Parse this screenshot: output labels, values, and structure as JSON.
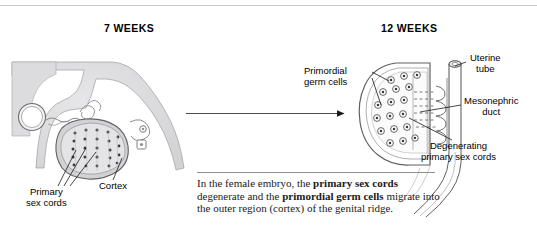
{
  "figure": {
    "stages": [
      {
        "id": "stage-7-weeks",
        "title": "7 WEEKS"
      },
      {
        "id": "stage-12-weeks",
        "title": "12 WEEKS"
      }
    ],
    "transition_arrow": {
      "direction": "right",
      "from_stage": "7 WEEKS",
      "to_stage": "12 WEEKS"
    }
  },
  "labels": {
    "primary_sex_cords": {
      "line1": "Primary",
      "line2": "sex cords"
    },
    "cortex": {
      "line1": "Cortex"
    },
    "primordial_germ_cells": {
      "line1": "Primordial",
      "line2": "germ cells"
    },
    "uterine_tube": {
      "line1": "Uterine",
      "line2": "tube"
    },
    "mesonephric_duct": {
      "line1": "Mesonephric",
      "line2": "duct"
    },
    "degenerating_primary_sex_cords": {
      "line1": "Degenerating",
      "line2": "primary sex cords"
    }
  },
  "caption": {
    "segment_1": "In the female embryo, the ",
    "bold_1": "primary sex cords",
    "segment_2": " degenerate and the ",
    "bold_2": "primordial germ cells",
    "segment_3": " migrate into the outer region (cortex) of the genital ridge."
  },
  "colors": {
    "tissue_fill": "#dcdcde",
    "tissue_outline": "#6e6f73",
    "cord_dots": "#3a3a3c",
    "ink": "#000000",
    "rule": "#c8c9cc",
    "background": "#ffffff"
  }
}
